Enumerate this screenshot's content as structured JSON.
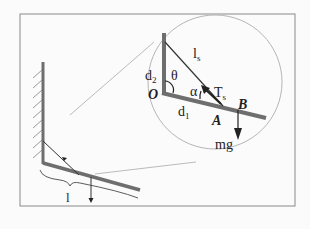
{
  "figure": {
    "labels": {
      "d2": "d",
      "d2_sub": "2",
      "theta": "θ",
      "ls": "l",
      "ls_sub": "s",
      "alpha": "α",
      "Ts": "T",
      "Ts_sub": "s",
      "O": "O",
      "B": "B",
      "A": "A",
      "d1": "d",
      "d1_sub": "1",
      "mg": "mg",
      "length": "l"
    },
    "colors": {
      "frame": "#8a8a8a",
      "rod": "#6e6e6e",
      "line": "#333333",
      "circle": "#b5b5b5",
      "background": "#fbfbfb"
    }
  }
}
